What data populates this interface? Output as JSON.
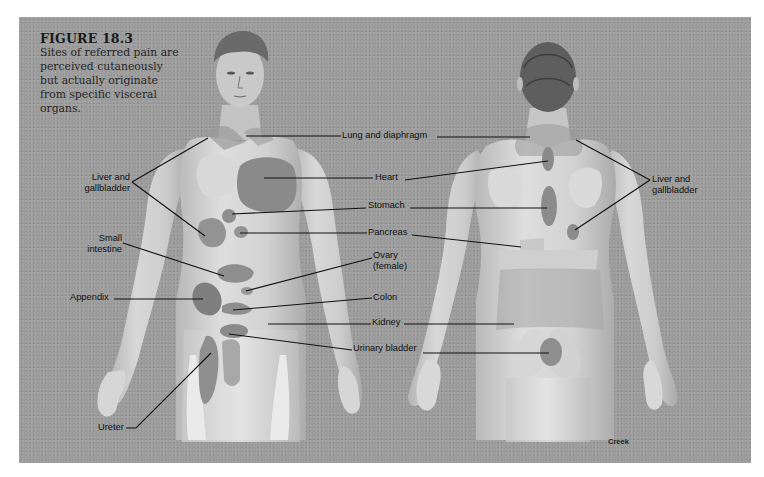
{
  "figure": {
    "number": "FIGURE 18.3",
    "caption_lines": [
      "Sites of referred pain are",
      "perceived cutaneously",
      "but actually originate",
      "from specific visceral",
      "organs."
    ],
    "signature": "Creek"
  },
  "views": [
    "anterior",
    "posterior"
  ],
  "labels": {
    "liver_left": [
      "Liver and",
      "gallbladder"
    ],
    "small_intestine": [
      "Small",
      "intestine"
    ],
    "appendix": "Appendix",
    "ureter": "Ureter",
    "lung": "Lung and diaphragm",
    "heart": "Heart",
    "stomach": "Stomach",
    "pancreas": "Pancreas",
    "ovary": [
      "Ovary",
      "(female)"
    ],
    "colon": "Colon",
    "kidney": "Kidney",
    "bladder": "Urinary bladder",
    "liver_right": [
      "Liver and",
      "gallbladder"
    ]
  },
  "colors": {
    "background": "#9c9c9c",
    "skin": "#cfcfcf",
    "skin_shade": "#b4b4b4",
    "referred_region": "#8a8a8a",
    "leader_line": "#111111",
    "hair": "#5a5a5a"
  }
}
